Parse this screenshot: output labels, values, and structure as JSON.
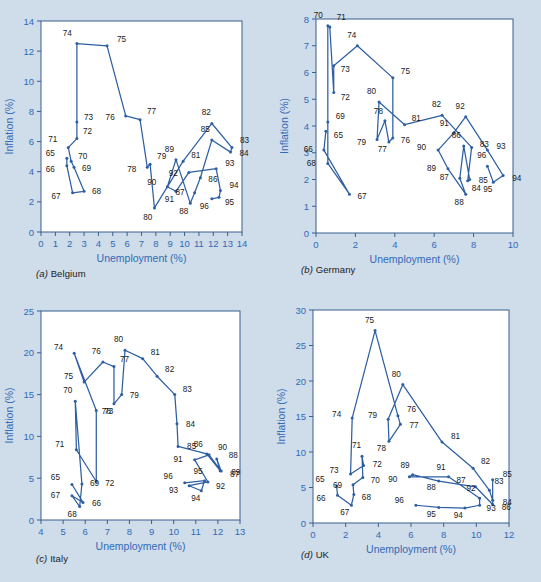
{
  "figure": {
    "background_color": "#cfdcea",
    "plot_background_color": "#ffffff",
    "line_color": "#2e5fa3",
    "axis_label_color": "#2f6bb5",
    "point_label_color": "#1a1a1a",
    "frame_color": "#3a5f8f"
  },
  "panels": [
    {
      "key": "belgium",
      "caption_letter": "(a)",
      "caption_name": "Belgium",
      "xlabel": "Unemployment (%)",
      "ylabel": "Inflation (%)",
      "xticks": [
        0,
        1,
        2,
        3,
        4,
        5,
        6,
        7,
        8,
        9,
        10,
        11,
        12,
        13,
        14
      ],
      "yticks": [
        0,
        2,
        4,
        6,
        8,
        10,
        12,
        14
      ],
      "xlim": [
        0,
        14
      ],
      "ylim": [
        0,
        14
      ]
    },
    {
      "key": "germany",
      "caption_letter": "(b)",
      "caption_name": "Germany",
      "xlabel": "Unemployment (%)",
      "ylabel": "Inflation (%)",
      "xticks": [
        0,
        2,
        4,
        6,
        8,
        10
      ],
      "yticks": [
        0,
        1,
        2,
        3,
        4,
        5,
        6,
        7,
        8
      ],
      "xlim": [
        0,
        10
      ],
      "ylim": [
        0,
        8
      ]
    },
    {
      "key": "italy",
      "caption_letter": "(c)",
      "caption_name": "Italy",
      "xlabel": "Unemployment (%)",
      "ylabel": "Inflation (%)",
      "xticks": [
        4,
        5,
        6,
        7,
        8,
        9,
        10,
        11,
        12,
        13
      ],
      "yticks": [
        0,
        5,
        10,
        15,
        20,
        25
      ],
      "xlim": [
        4,
        13
      ],
      "ylim": [
        0,
        25
      ]
    },
    {
      "key": "uk",
      "caption_letter": "(d)",
      "caption_name": "UK",
      "xlabel": "Unemployment (%)",
      "ylabel": "Inflation (%)",
      "xticks": [
        0,
        2,
        4,
        6,
        8,
        10,
        12
      ],
      "yticks": [
        0,
        5,
        10,
        15,
        20,
        25,
        30
      ],
      "xlim": [
        0,
        12
      ],
      "ylim": [
        0,
        30
      ]
    }
  ],
  "chart_data": [
    {
      "type": "line",
      "title": "(a) Belgium",
      "xlabel": "Unemployment (%)",
      "ylabel": "Inflation (%)",
      "xlim": [
        0,
        14
      ],
      "ylim": [
        0,
        14
      ],
      "grid": false,
      "legend": "none",
      "point_labels": [
        "65",
        "66",
        "67",
        "68",
        "69",
        "70",
        "71",
        "72",
        "73",
        "74",
        "75",
        "76",
        "77",
        "78",
        "79",
        "80",
        "81",
        "82",
        "83",
        "84",
        "85",
        "86",
        "87",
        "88",
        "89",
        "90",
        "91",
        "92",
        "93",
        "94",
        "95",
        "96"
      ],
      "x": [
        1.8,
        1.8,
        2.2,
        3.0,
        2.3,
        2.1,
        1.9,
        2.5,
        2.5,
        2.5,
        4.6,
        5.9,
        6.9,
        7.4,
        7.6,
        7.9,
        9.9,
        11.9,
        13.3,
        13.2,
        11.9,
        11.1,
        10.7,
        10.4,
        9.4,
        8.8,
        9.4,
        10.3,
        12.2,
        12.5,
        12.4,
        11.9
      ],
      "y": [
        4.9,
        4.4,
        2.6,
        2.7,
        4.3,
        4.7,
        5.6,
        6.2,
        7.3,
        12.5,
        12.35,
        7.7,
        7.45,
        4.3,
        4.5,
        1.6,
        4.7,
        7.2,
        5.6,
        5.3,
        6.1,
        3.6,
        2.6,
        1.9,
        4.8,
        3.0,
        2.7,
        3.95,
        4.2,
        2.75,
        2.3,
        2.2
      ],
      "label_offsets": [
        [
          "65",
          -12,
          -2
        ],
        [
          "66",
          -12,
          6
        ],
        [
          "67",
          -12,
          6
        ],
        [
          "68",
          8,
          3
        ],
        [
          "69",
          8,
          4
        ],
        [
          "70",
          7,
          -2
        ],
        [
          "71",
          -11,
          -6
        ],
        [
          "72",
          6,
          -5
        ],
        [
          "73",
          7,
          -2
        ],
        [
          "74",
          -5,
          -8
        ],
        [
          "75",
          10,
          -4
        ],
        [
          "76",
          -11,
          4
        ],
        [
          "77",
          7,
          -6
        ],
        [
          "78",
          -11,
          5
        ],
        [
          "79",
          7,
          -5
        ],
        [
          "80",
          -2,
          12
        ],
        [
          "81",
          8,
          -3
        ],
        [
          "82",
          -1,
          -8
        ],
        [
          "83",
          8,
          -5
        ],
        [
          "84",
          9,
          4
        ],
        [
          "85",
          -2,
          -8
        ],
        [
          "86",
          8,
          4
        ],
        [
          "87",
          -10,
          2
        ],
        [
          "88",
          -2,
          11
        ],
        [
          "89",
          -2,
          -8
        ],
        [
          "90",
          -11,
          -2
        ],
        [
          "91",
          -2,
          11
        ],
        [
          "92",
          -11,
          4
        ],
        [
          "93",
          9,
          -3
        ],
        [
          "94",
          9,
          -3
        ],
        [
          "95",
          6,
          8
        ],
        [
          "96",
          -3,
          10
        ]
      ]
    },
    {
      "type": "line",
      "title": "(b) Germany",
      "xlabel": "Unemployment (%)",
      "ylabel": "Inflation (%)",
      "xlim": [
        0,
        10
      ],
      "ylim": [
        0,
        8
      ],
      "grid": false,
      "legend": "none",
      "point_labels": [
        "65",
        "66",
        "67",
        "68",
        "69",
        "70",
        "71",
        "72",
        "73",
        "74",
        "75",
        "76",
        "77",
        "78",
        "79",
        "80",
        "81",
        "82",
        "83",
        "84",
        "85",
        "86",
        "87",
        "88",
        "89",
        "90",
        "91",
        "92",
        "93",
        "94",
        "95",
        "96"
      ],
      "x": [
        0.5,
        0.4,
        1.7,
        0.6,
        0.6,
        0.6,
        0.7,
        0.9,
        0.9,
        2.1,
        3.9,
        3.9,
        3.7,
        3.5,
        3.1,
        3.2,
        4.5,
        6.4,
        7.9,
        7.7,
        7.8,
        7.5,
        7.3,
        7.6,
        6.7,
        6.2,
        7.0,
        7.6,
        8.7,
        9.5,
        9.0,
        8.7
      ],
      "y": [
        3.8,
        3.1,
        1.45,
        2.6,
        4.15,
        7.75,
        7.7,
        5.25,
        6.25,
        7.0,
        5.8,
        3.55,
        3.4,
        4.2,
        3.5,
        4.9,
        4.05,
        4.4,
        3.2,
        1.95,
        2.0,
        3.25,
        2.05,
        1.45,
        2.4,
        3.1,
        3.75,
        4.35,
        3.1,
        2.15,
        1.9,
        2.5
      ],
      "label_offsets": [
        [
          "65",
          8,
          7
        ],
        [
          "66",
          -11,
          2
        ],
        [
          "67",
          8,
          5
        ],
        [
          "68",
          -12,
          3
        ],
        [
          "69",
          8,
          -3
        ],
        [
          "70",
          -5,
          -8
        ],
        [
          "71",
          7,
          -7
        ],
        [
          "72",
          7,
          7
        ],
        [
          "73",
          7,
          6
        ],
        [
          "74",
          -1,
          -8
        ],
        [
          "75",
          8,
          -4
        ],
        [
          "76",
          8,
          5
        ],
        [
          "77",
          -2,
          10
        ],
        [
          "78",
          -2,
          -7
        ],
        [
          "79",
          -11,
          6
        ],
        [
          "80",
          -3,
          -8
        ],
        [
          "81",
          7,
          -4
        ],
        [
          "82",
          -1,
          -8
        ],
        [
          "83",
          8,
          0
        ],
        [
          "84",
          4,
          10
        ],
        [
          "85",
          9,
          3
        ],
        [
          "86",
          -3,
          -8
        ],
        [
          "87",
          -11,
          2
        ],
        [
          "88",
          -2,
          11
        ],
        [
          "89",
          -12,
          2
        ],
        [
          "90",
          -12,
          0
        ],
        [
          "91",
          -5,
          -7
        ],
        [
          "92",
          -1,
          -8
        ],
        [
          "93",
          9,
          -1
        ],
        [
          "94",
          9,
          6
        ],
        [
          "95",
          -1,
          10
        ],
        [
          "96",
          -1,
          -8
        ]
      ]
    },
    {
      "type": "line",
      "title": "(c) Italy",
      "xlabel": "Unemployment (%)",
      "ylabel": "Inflation (%)",
      "xlim": [
        4,
        13
      ],
      "ylim": [
        0,
        25
      ],
      "grid": false,
      "legend": "none",
      "point_labels": [
        "65",
        "66",
        "67",
        "68",
        "69",
        "70",
        "71",
        "72",
        "73",
        "74",
        "75",
        "76",
        "77",
        "78",
        "79",
        "80",
        "81",
        "82",
        "83",
        "84",
        "85",
        "86",
        "87",
        "88",
        "89",
        "90",
        "91",
        "92",
        "93",
        "94",
        "95",
        "96"
      ],
      "x": [
        5.4,
        5.9,
        5.4,
        5.75,
        5.85,
        5.55,
        5.6,
        6.5,
        6.5,
        5.5,
        5.95,
        6.8,
        7.3,
        7.3,
        7.65,
        7.8,
        8.6,
        9.25,
        10.05,
        10.15,
        10.2,
        11.5,
        12.1,
        11.95,
        12.15,
        11.6,
        10.95,
        11.55,
        10.7,
        11.25,
        11.4,
        10.5
      ],
      "y": [
        4.25,
        2.1,
        2.9,
        1.6,
        4.3,
        14.2,
        8.4,
        4.6,
        13.1,
        19.95,
        16.5,
        18.9,
        18.35,
        13.9,
        15.0,
        20.3,
        19.3,
        17.2,
        15.0,
        11.5,
        8.8,
        7.9,
        5.9,
        7.3,
        5.85,
        7.8,
        7.2,
        4.55,
        4.1,
        3.5,
        4.7,
        4.45
      ],
      "label_offsets": [
        [
          "65",
          -12,
          -4
        ],
        [
          "66",
          9,
          4
        ],
        [
          "67",
          -12,
          2
        ],
        [
          "68",
          -3,
          10
        ],
        [
          "69",
          8,
          2
        ],
        [
          "70",
          -3,
          -8
        ],
        [
          "71",
          -12,
          -3
        ],
        [
          "72",
          9,
          4
        ],
        [
          "73",
          8,
          4
        ],
        [
          "74",
          -11,
          -3
        ],
        [
          "75",
          -11,
          -3
        ],
        [
          "76",
          -2,
          -8
        ],
        [
          "77",
          6,
          -5
        ],
        [
          "78",
          -3,
          10
        ],
        [
          "79",
          8,
          3
        ],
        [
          "80",
          -2,
          -8
        ],
        [
          "81",
          8,
          -4
        ],
        [
          "82",
          8,
          -4
        ],
        [
          "83",
          8,
          -3
        ],
        [
          "84",
          9,
          3
        ],
        [
          "85",
          9,
          3
        ],
        [
          "86",
          -4,
          -7
        ],
        [
          "87",
          10,
          6
        ],
        [
          "88",
          12,
          -1
        ],
        [
          "89",
          10,
          4
        ],
        [
          "90",
          9,
          -5
        ],
        [
          "91",
          -12,
          2
        ],
        [
          "92",
          8,
          7
        ],
        [
          "93",
          -11,
          7
        ],
        [
          "94",
          -1,
          10
        ],
        [
          "95",
          -2,
          -7
        ],
        [
          "96",
          -12,
          -4
        ]
      ]
    },
    {
      "type": "line",
      "title": "(d) UK",
      "xlabel": "Unemployment (%)",
      "ylabel": "Inflation (%)",
      "xlim": [
        0,
        12
      ],
      "ylim": [
        0,
        30
      ],
      "grid": false,
      "legend": "none",
      "point_labels": [
        "65",
        "66",
        "67",
        "68",
        "69",
        "70",
        "71",
        "72",
        "73",
        "74",
        "75",
        "76",
        "77",
        "78",
        "79",
        "80",
        "81",
        "82",
        "83",
        "84",
        "85",
        "86",
        "87",
        "88",
        "89",
        "90",
        "91",
        "92",
        "93",
        "94",
        "95",
        "96"
      ],
      "x": [
        1.45,
        1.5,
        2.35,
        2.5,
        2.45,
        3.05,
        3.0,
        3.1,
        2.3,
        2.4,
        3.8,
        5.2,
        5.35,
        4.65,
        4.6,
        5.5,
        7.9,
        9.8,
        10.8,
        11.0,
        11.0,
        11.0,
        9.95,
        7.7,
        6.1,
        5.9,
        8.3,
        10.2,
        10.2,
        9.3,
        7.7,
        6.3
      ],
      "y": [
        5.2,
        3.9,
        2.5,
        4.0,
        5.4,
        6.4,
        9.4,
        8.1,
        6.9,
        14.8,
        27.1,
        15.1,
        13.9,
        11.5,
        14.6,
        19.5,
        11.4,
        7.7,
        4.6,
        3.2,
        6.1,
        2.6,
        5.1,
        5.9,
        6.8,
        6.5,
        6.5,
        3.5,
        2.5,
        2.1,
        2.2,
        2.5
      ],
      "label_offsets": [
        [
          "65",
          -12,
          -4
        ],
        [
          "66",
          -12,
          6
        ],
        [
          "67",
          -2,
          10
        ],
        [
          "68",
          8,
          5
        ],
        [
          "69",
          -11,
          3
        ],
        [
          "70",
          8,
          5
        ],
        [
          "71",
          -1,
          -8
        ],
        [
          "72",
          9,
          2
        ],
        [
          "73",
          -12,
          -1
        ],
        [
          "74",
          -11,
          -1
        ],
        [
          "75",
          -1,
          -8
        ],
        [
          "76",
          9,
          -4
        ],
        [
          "77",
          9,
          4
        ],
        [
          "78",
          -3,
          10
        ],
        [
          "79",
          -11,
          -1
        ],
        [
          "80",
          -2,
          -8
        ],
        [
          "81",
          9,
          -3
        ],
        [
          "82",
          8,
          -4
        ],
        [
          "83",
          5,
          -6
        ],
        [
          "84",
          10,
          5
        ],
        [
          "85",
          10,
          -3
        ],
        [
          "86",
          9,
          5
        ],
        [
          "87",
          -10,
          -4
        ],
        [
          "88",
          -3,
          9
        ],
        [
          "89",
          -3,
          -7
        ],
        [
          "90",
          -12,
          5
        ],
        [
          "91",
          -3,
          -7
        ],
        [
          "92",
          -4,
          -7
        ],
        [
          "93",
          7,
          6
        ],
        [
          "94",
          -2,
          10
        ],
        [
          "95",
          -3,
          10
        ],
        [
          "96",
          -12,
          -2
        ]
      ]
    }
  ]
}
